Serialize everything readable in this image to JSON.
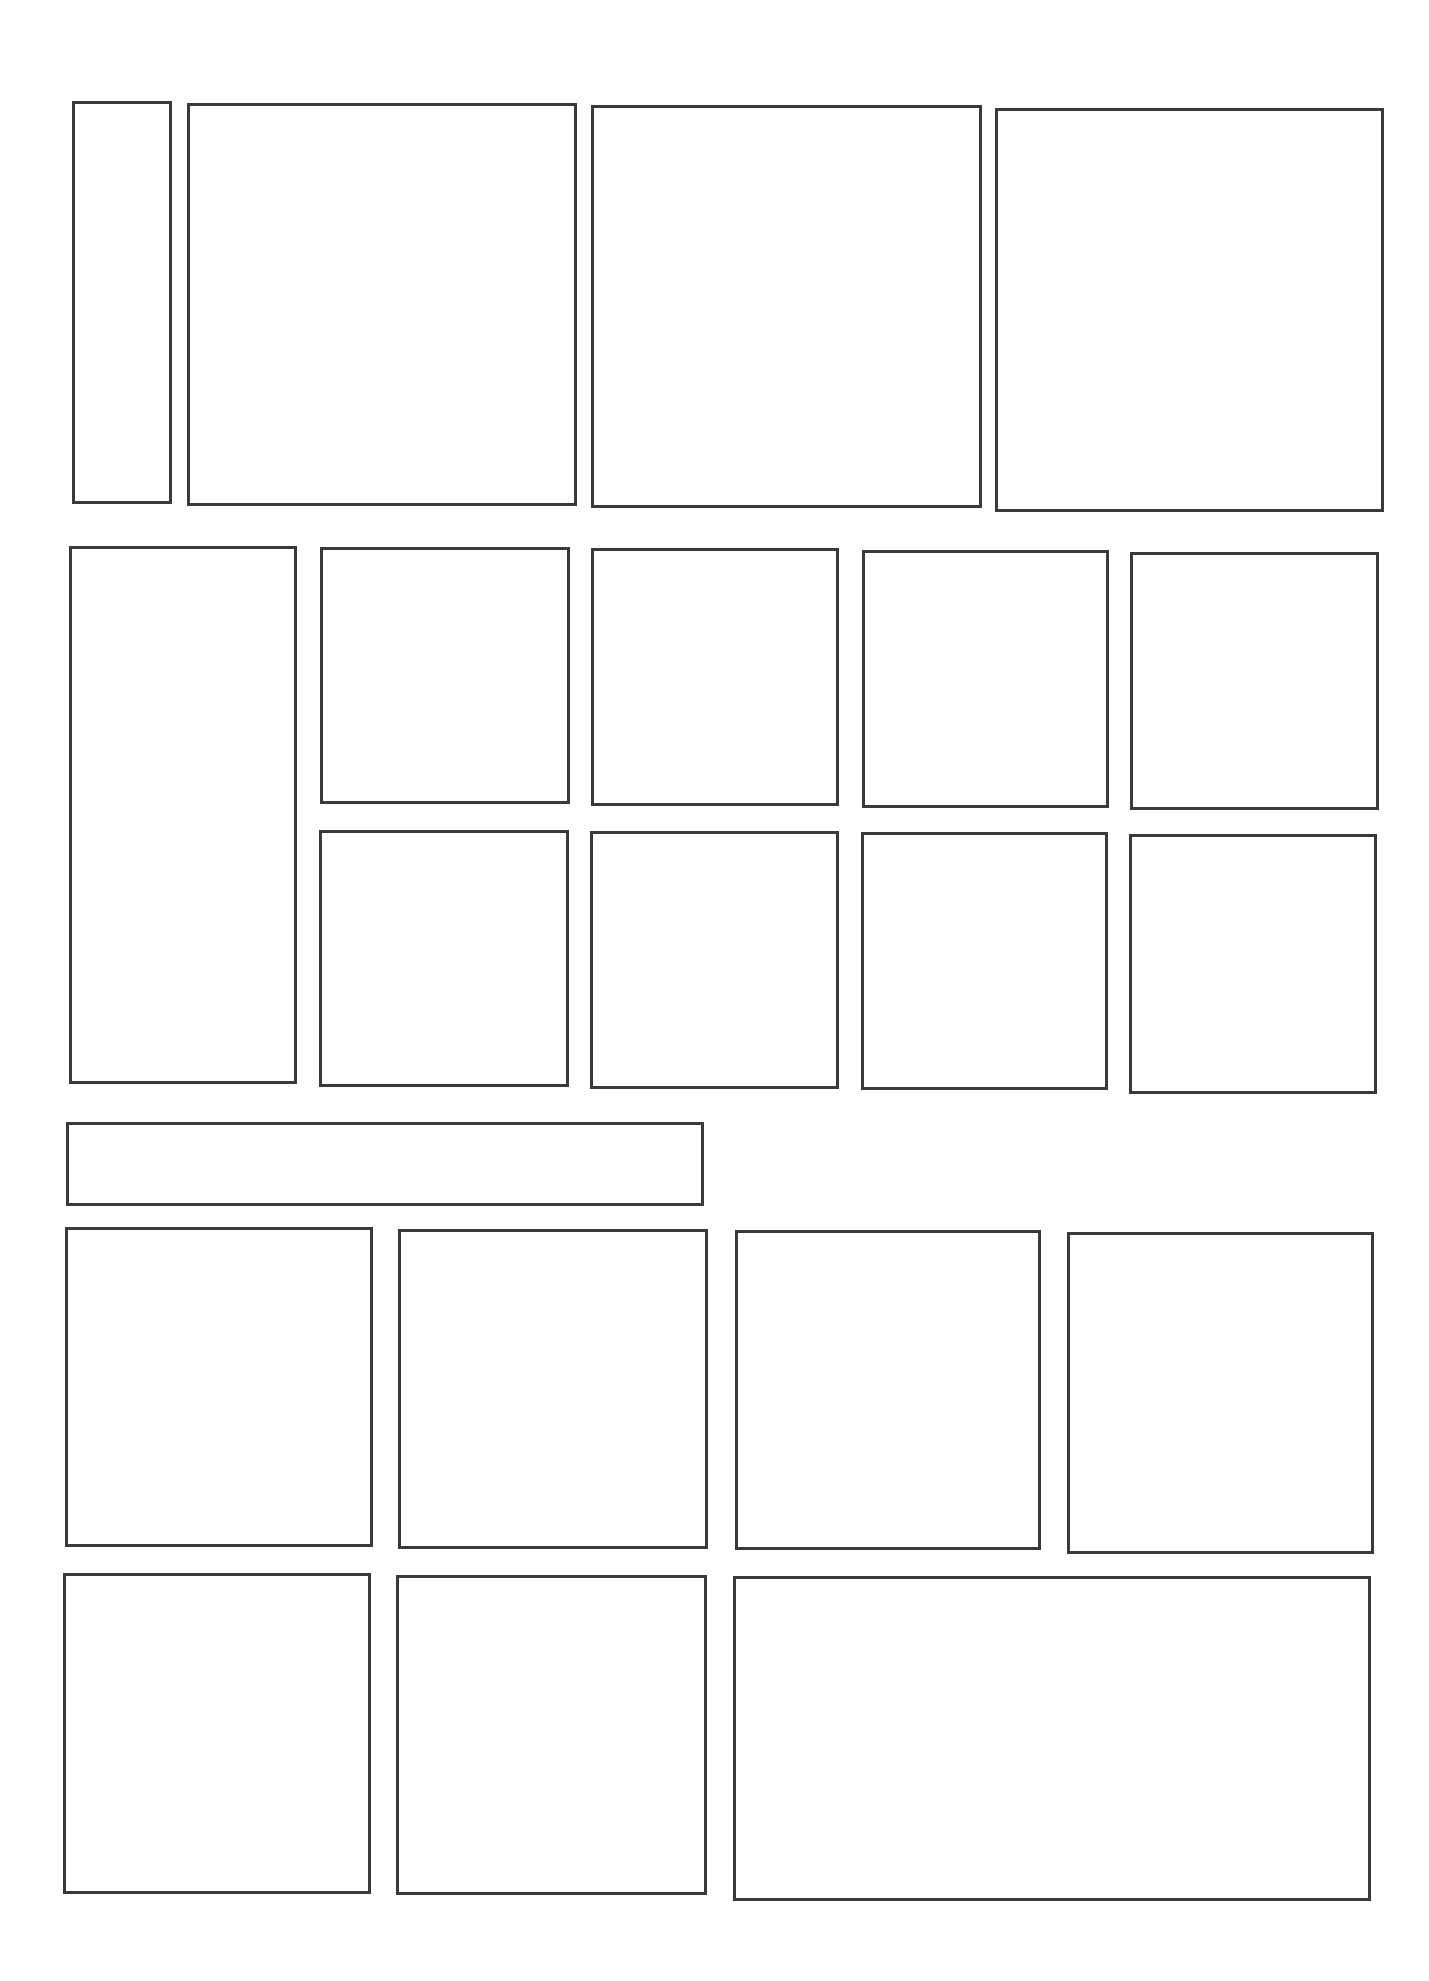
{
  "page": {
    "type": "comic-panel-layout-template",
    "background": "#ffffff",
    "border_color": "#3a3a3a",
    "panel_count": 21
  },
  "panels": [
    {
      "id": "p1",
      "row": 1,
      "x": 72,
      "y": 101,
      "w": 100,
      "h": 403
    },
    {
      "id": "p2",
      "row": 1,
      "x": 187,
      "y": 103,
      "w": 390,
      "h": 403
    },
    {
      "id": "p3",
      "row": 1,
      "x": 591,
      "y": 105,
      "w": 391,
      "h": 403
    },
    {
      "id": "p4",
      "row": 1,
      "x": 995,
      "y": 108,
      "w": 389,
      "h": 404
    },
    {
      "id": "p5",
      "row": 2,
      "x": 69,
      "y": 546,
      "w": 228,
      "h": 538
    },
    {
      "id": "p6",
      "row": 2,
      "x": 320,
      "y": 547,
      "w": 250,
      "h": 257
    },
    {
      "id": "p7",
      "row": 2,
      "x": 591,
      "y": 548,
      "w": 248,
      "h": 258
    },
    {
      "id": "p8",
      "row": 2,
      "x": 862,
      "y": 550,
      "w": 247,
      "h": 258
    },
    {
      "id": "p9",
      "row": 2,
      "x": 1130,
      "y": 552,
      "w": 249,
      "h": 258
    },
    {
      "id": "p10",
      "row": 2,
      "x": 319,
      "y": 830,
      "w": 250,
      "h": 257
    },
    {
      "id": "p11",
      "row": 2,
      "x": 590,
      "y": 831,
      "w": 249,
      "h": 258
    },
    {
      "id": "p12",
      "row": 2,
      "x": 861,
      "y": 832,
      "w": 247,
      "h": 258
    },
    {
      "id": "p13",
      "row": 2,
      "x": 1129,
      "y": 834,
      "w": 248,
      "h": 260
    },
    {
      "id": "p14",
      "row": 3,
      "x": 66,
      "y": 1122,
      "w": 638,
      "h": 84
    },
    {
      "id": "p15",
      "row": 4,
      "x": 65,
      "y": 1227,
      "w": 308,
      "h": 320
    },
    {
      "id": "p16",
      "row": 4,
      "x": 398,
      "y": 1229,
      "w": 310,
      "h": 320
    },
    {
      "id": "p17",
      "row": 4,
      "x": 735,
      "y": 1230,
      "w": 306,
      "h": 320
    },
    {
      "id": "p18",
      "row": 4,
      "x": 1067,
      "y": 1232,
      "w": 307,
      "h": 322
    },
    {
      "id": "p19",
      "row": 5,
      "x": 63,
      "y": 1573,
      "w": 308,
      "h": 321
    },
    {
      "id": "p20",
      "row": 5,
      "x": 396,
      "y": 1575,
      "w": 311,
      "h": 320
    },
    {
      "id": "p21",
      "row": 5,
      "x": 733,
      "y": 1576,
      "w": 638,
      "h": 325
    }
  ]
}
